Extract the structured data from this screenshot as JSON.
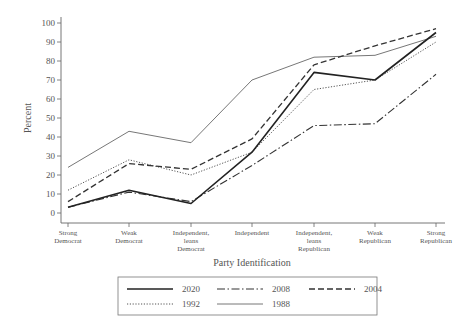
{
  "chart_data": {
    "type": "line",
    "title": "",
    "xlabel": "Party Identification",
    "ylabel": "Percent",
    "ylim": [
      0,
      100
    ],
    "yticks": [
      0,
      10,
      20,
      30,
      40,
      50,
      60,
      70,
      80,
      90,
      100
    ],
    "grid": false,
    "legend_position": "bottom",
    "categories": [
      [
        "Strong",
        "Democrat"
      ],
      [
        "Weak",
        "Democrat"
      ],
      [
        "Independent,",
        "leans",
        "Democrat"
      ],
      [
        "Independent"
      ],
      [
        "Independent,",
        "leans",
        "Republican"
      ],
      [
        "Weak",
        "Republican"
      ],
      [
        "Strong",
        "Republican"
      ]
    ],
    "series": [
      {
        "name": "2020",
        "style": "solid",
        "color": "#222222",
        "width": 1.6,
        "values": [
          3,
          12,
          5,
          32,
          74,
          70,
          95
        ]
      },
      {
        "name": "2008",
        "style": "dashdot",
        "color": "#333333",
        "width": 1.1,
        "values": [
          3,
          11,
          6,
          25,
          46,
          47,
          73
        ]
      },
      {
        "name": "2004",
        "style": "dashed",
        "color": "#333333",
        "width": 1.3,
        "values": [
          6,
          26,
          23,
          39,
          78,
          88,
          97
        ]
      },
      {
        "name": "1992",
        "style": "dotted",
        "color": "#555555",
        "width": 1.0,
        "values": [
          12,
          28,
          20,
          32,
          65,
          70,
          90
        ]
      },
      {
        "name": "1988",
        "style": "solid",
        "color": "#777777",
        "width": 1.0,
        "values": [
          24,
          43,
          37,
          70,
          82,
          83,
          93
        ]
      }
    ],
    "legend_rows": [
      [
        "2020",
        "2008",
        "2004"
      ],
      [
        "1992",
        "1988"
      ]
    ]
  }
}
